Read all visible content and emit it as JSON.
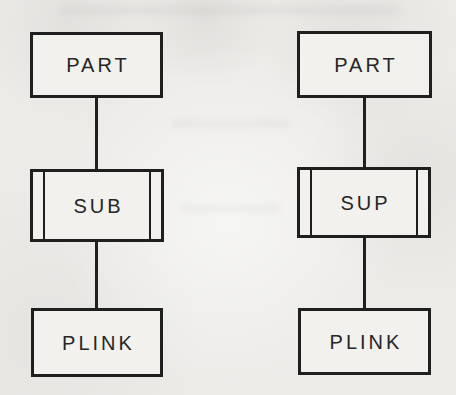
{
  "figure": {
    "left_diagram": {
      "top_box_label": "PART",
      "middle_box_label": "SUB",
      "bottom_box_label": "PLINK"
    },
    "right_diagram": {
      "top_box_label": "PART",
      "middle_box_label": "SUP",
      "bottom_box_label": "PLINK"
    },
    "colors": {
      "paper": "#ecebe8",
      "ink": "#1f1f1f",
      "box_fill": "#f2f1ee"
    }
  }
}
